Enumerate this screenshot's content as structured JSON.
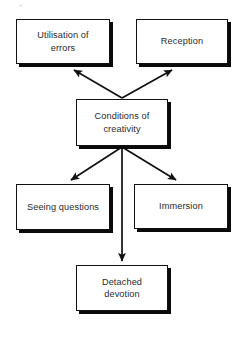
{
  "diagram": {
    "title": "Conditions of creativity",
    "type": "hierarchy-flow",
    "background_color": "#ffffff",
    "box_border_color": "#111111",
    "box_fill_color": "#ffffff",
    "box_shadow_color": "#0a0a0a",
    "text_color": "#2b2b2b",
    "arrow_color": "#111111",
    "nodes": [
      {
        "id": "conditions",
        "label": "Conditions of\ncreativity",
        "role": "root"
      },
      {
        "id": "utilisation_errors",
        "label": "Utilisation of\nerrors",
        "role": "branch"
      },
      {
        "id": "reception",
        "label": "Reception",
        "role": "branch"
      },
      {
        "id": "seeing_questions",
        "label": "Seeing questions",
        "role": "branch"
      },
      {
        "id": "immersion",
        "label": "Immersion",
        "role": "branch"
      },
      {
        "id": "detached_devotion",
        "label": "Detached\ndevotion",
        "role": "branch"
      }
    ],
    "edges": [
      {
        "from": "conditions",
        "to": "utilisation_errors",
        "direction": "up-left"
      },
      {
        "from": "conditions",
        "to": "reception",
        "direction": "up-right"
      },
      {
        "from": "conditions",
        "to": "seeing_questions",
        "direction": "down-left"
      },
      {
        "from": "conditions",
        "to": "immersion",
        "direction": "down-right"
      },
      {
        "from": "conditions",
        "to": "detached_devotion",
        "direction": "down"
      }
    ]
  }
}
